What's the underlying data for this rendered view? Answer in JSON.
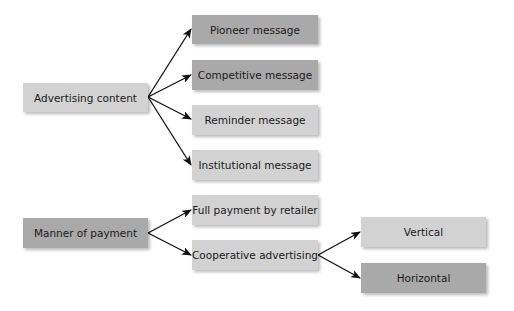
{
  "colors": {
    "light_box": "#d2d2d2",
    "dark_box": "#a9a9a9",
    "arrow": "#111111",
    "text": "#1a1a1a"
  },
  "diagram": {
    "groups": [
      {
        "root": {
          "label": "Advertising content",
          "shade": "light"
        },
        "children": [
          {
            "label": "Pioneer message",
            "shade": "dark"
          },
          {
            "label": "Competitive message",
            "shade": "dark"
          },
          {
            "label": "Reminder message",
            "shade": "light"
          },
          {
            "label": "Institutional message",
            "shade": "light"
          }
        ]
      },
      {
        "root": {
          "label": "Manner of payment",
          "shade": "dark"
        },
        "children": [
          {
            "label": "Full payment by retailer",
            "shade": "light"
          },
          {
            "label": "Cooperative advertising",
            "shade": "light",
            "children": [
              {
                "label": "Vertical",
                "shade": "light"
              },
              {
                "label": "Horizontal",
                "shade": "dark"
              }
            ]
          }
        ]
      }
    ]
  }
}
